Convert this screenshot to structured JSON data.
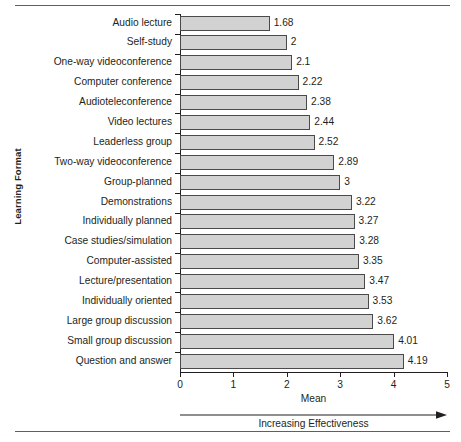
{
  "chart_data": {
    "type": "bar",
    "orientation": "horizontal",
    "title": "",
    "xlabel": "Mean",
    "ylabel": "Learning Format",
    "xlim": [
      0,
      5
    ],
    "xticks": [
      "0",
      "1",
      "2",
      "3",
      "4",
      "5"
    ],
    "grid": false,
    "legend": null,
    "annotation": "Increasing Effectiveness",
    "bar_color": "#d2d2d2",
    "bar_border_color": "#4a4a4a",
    "categories": [
      "Audio lecture",
      "Self-study",
      "One-way videoconference",
      "Computer conference",
      "Audioteleconference",
      "Video lectures",
      "Leaderless group",
      "Two-way videoconference",
      "Group-planned",
      "Demonstrations",
      "Individually planned",
      "Case studies/simulation",
      "Computer-assisted",
      "Lecture/presentation",
      "Individually oriented",
      "Large group discussion",
      "Small group discussion",
      "Question and answer"
    ],
    "values": [
      1.68,
      2,
      2.1,
      2.22,
      2.38,
      2.44,
      2.52,
      2.89,
      3,
      3.22,
      3.27,
      3.28,
      3.35,
      3.47,
      3.53,
      3.62,
      4.01,
      4.19
    ],
    "value_labels": [
      "1.68",
      "2",
      "2.1",
      "2.22",
      "2.38",
      "2.44",
      "2.52",
      "2.89",
      "3",
      "3.22",
      "3.27",
      "3.28",
      "3.35",
      "3.47",
      "3.53",
      "3.62",
      "4.01",
      "4.19"
    ]
  }
}
